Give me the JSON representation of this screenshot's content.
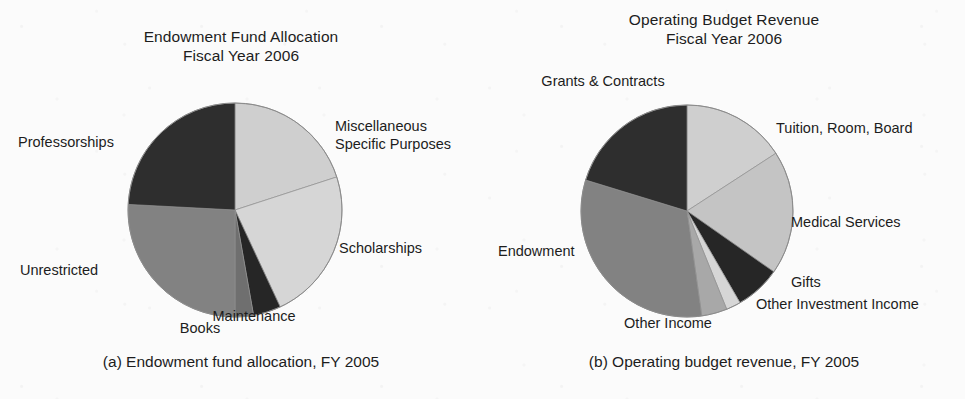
{
  "figure": {
    "background_color": "#fbfbfb",
    "text_color": "#1d1d1a"
  },
  "palette": {
    "black": "#262626",
    "dark_gray": "#3a3a3a",
    "mid_gray": "#828282",
    "light_mid_gray": "#a8a8a8",
    "light_gray": "#cfcfcf",
    "pale_gray": "#dcdcdc",
    "outline": "#9a9a9a"
  },
  "panels": [
    {
      "id": "endowment-fund-allocation",
      "title": "Endowment Fund Allocation\nFiscal Year 2006",
      "caption": "(a) Endowment fund allocation, FY 2005",
      "labels": [
        {
          "text": "Miscellaneous\nSpecific Purposes",
          "align": "lbl-right",
          "x": 335,
          "y": 118
        },
        {
          "text": "Professorships",
          "align": "lbl-left",
          "x": 18,
          "y": 134
        },
        {
          "text": "Scholarships",
          "align": "lbl-right",
          "x": 339,
          "y": 240
        },
        {
          "text": "Unrestricted",
          "align": "lbl-left",
          "x": 20,
          "y": 262
        },
        {
          "text": "Books",
          "align": "lbl-center",
          "x": 200,
          "y": 320
        },
        {
          "text": "Maintenance",
          "align": "lbl-center",
          "x": 254,
          "y": 308
        }
      ]
    },
    {
      "id": "operating-budget-revenue",
      "title": "Operating Budget Revenue\nFiscal Year 2006",
      "caption": "(b) Operating budget revenue, FY 2005",
      "labels": [
        {
          "text": "Grants & Contracts",
          "align": "lbl-center",
          "x": 120,
          "y": 73
        },
        {
          "text": "Tuition, Room, Board",
          "align": "lbl-right",
          "x": 293,
          "y": 120
        },
        {
          "text": "Medical Services",
          "align": "lbl-right",
          "x": 308,
          "y": 214
        },
        {
          "text": "Gifts",
          "align": "lbl-right",
          "x": 308,
          "y": 274
        },
        {
          "text": "Other Investment Income",
          "align": "lbl-right",
          "x": 273,
          "y": 296
        },
        {
          "text": "Endowment",
          "align": "lbl-left",
          "x": 15,
          "y": 243
        },
        {
          "text": "Other Income",
          "align": "lbl-center",
          "x": 185,
          "y": 315
        }
      ]
    }
  ],
  "chart_data": [
    {
      "type": "pie",
      "title": "Endowment Fund Allocation Fiscal Year 2006",
      "caption": "(a) Endowment fund allocation, FY 2005",
      "start_angle_deg": 0,
      "direction": "clockwise",
      "units": "percent",
      "center": {
        "x": 234,
        "y": 209
      },
      "radius": 107,
      "categories": [
        "Miscellaneous Specific Purposes",
        "Scholarships",
        "Maintenance",
        "Books",
        "Unrestricted",
        "Professorships"
      ],
      "values": [
        20,
        23,
        4,
        3,
        26,
        24
      ],
      "slices": [
        {
          "label": "Miscellaneous Specific Purposes",
          "value": 20,
          "start_deg": 0,
          "end_deg": 72,
          "color": "#cfcfcf"
        },
        {
          "label": "Scholarships",
          "value": 23,
          "start_deg": 72,
          "end_deg": 155,
          "color": "#d6d6d6"
        },
        {
          "label": "Maintenance",
          "value": 4,
          "start_deg": 155,
          "end_deg": 170,
          "color": "#262626"
        },
        {
          "label": "Books",
          "value": 3,
          "start_deg": 170,
          "end_deg": 180,
          "color": "#6f6f6f"
        },
        {
          "label": "Unrestricted",
          "value": 26,
          "start_deg": 180,
          "end_deg": 273,
          "color": "#828282"
        },
        {
          "label": "Professorships",
          "value": 24,
          "start_deg": 273,
          "end_deg": 360,
          "color": "#2e2e2e"
        }
      ],
      "legend_position": "outside-labels",
      "grid": false
    },
    {
      "type": "pie",
      "title": "Operating Budget Revenue Fiscal Year 2006",
      "caption": "(b) Operating budget revenue, FY 2005",
      "start_angle_deg": 0,
      "direction": "clockwise",
      "units": "percent",
      "center": {
        "x": 203,
        "y": 210
      },
      "radius": 106,
      "categories": [
        "Tuition, Room, Board",
        "Medical Services",
        "Gifts",
        "Other Investment Income",
        "Other Income",
        "Endowment",
        "Grants & Contracts"
      ],
      "values": [
        16,
        19,
        7,
        2,
        4,
        32,
        20
      ],
      "slices": [
        {
          "label": "Tuition, Room, Board",
          "value": 16,
          "start_deg": 0,
          "end_deg": 57,
          "color": "#cfcfcf"
        },
        {
          "label": "Medical Services",
          "value": 19,
          "start_deg": 57,
          "end_deg": 125,
          "color": "#c4c4c4"
        },
        {
          "label": "Gifts",
          "value": 7,
          "start_deg": 125,
          "end_deg": 150,
          "color": "#262626"
        },
        {
          "label": "Other Investment Income",
          "value": 2,
          "start_deg": 150,
          "end_deg": 158,
          "color": "#d6d6d6"
        },
        {
          "label": "Other Income",
          "value": 4,
          "start_deg": 158,
          "end_deg": 172,
          "color": "#a8a8a8"
        },
        {
          "label": "Endowment",
          "value": 32,
          "start_deg": 172,
          "end_deg": 287,
          "color": "#828282"
        },
        {
          "label": "Grants & Contracts",
          "value": 20,
          "start_deg": 287,
          "end_deg": 360,
          "color": "#2e2e2e"
        }
      ],
      "legend_position": "outside-labels",
      "grid": false
    }
  ]
}
